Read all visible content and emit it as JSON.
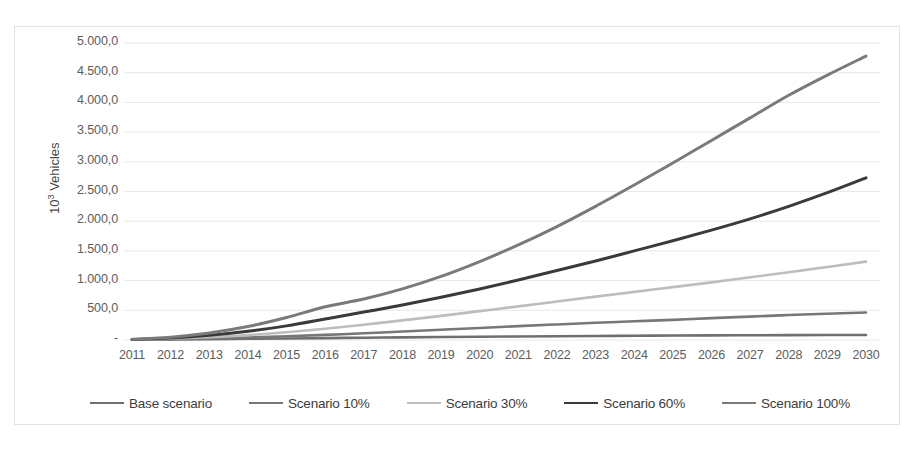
{
  "chart_data": {
    "type": "line",
    "title": "",
    "xlabel": "",
    "ylabel": "10³ Vehicles",
    "ylabel_html": "10<sup>3</sup> Vehicles",
    "grid": true,
    "legend_position": "bottom",
    "xlim": [
      2011,
      2030
    ],
    "ylim": [
      0,
      5000
    ],
    "ytick_values": [
      5000,
      4500,
      4000,
      3500,
      3000,
      2500,
      2000,
      1500,
      1000,
      500,
      0
    ],
    "ytick_labels": [
      "5.000,0",
      "4.500,0",
      "4.000,0",
      "3.500,0",
      "3.000,0",
      "2.500,0",
      "2.000,0",
      "1.500,0",
      "1.000,0",
      "500,0",
      "-"
    ],
    "categories": [
      2011,
      2012,
      2013,
      2014,
      2015,
      2016,
      2017,
      2018,
      2019,
      2020,
      2021,
      2022,
      2023,
      2024,
      2025,
      2026,
      2027,
      2028,
      2029,
      2030
    ],
    "xtick_labels": [
      "2011",
      "2012",
      "2013",
      "2014",
      "2015",
      "2016",
      "2017",
      "2018",
      "2019",
      "2020",
      "2021",
      "2022",
      "2023",
      "2024",
      "2025",
      "2026",
      "2027",
      "2028",
      "2029",
      "2030"
    ],
    "series": [
      {
        "name": "Base scenario",
        "color": "#6f6f6f",
        "width": 2.6,
        "values": [
          5,
          9,
          14,
          20,
          26,
          32,
          38,
          44,
          50,
          55,
          60,
          64,
          68,
          72,
          75,
          78,
          80,
          82,
          84,
          85
        ]
      },
      {
        "name": "Scenario 10%",
        "color": "#777777",
        "width": 2.6,
        "values": [
          6,
          14,
          26,
          42,
          62,
          86,
          113,
          142,
          172,
          203,
          233,
          262,
          290,
          315,
          338,
          369,
          394,
          420,
          442,
          462
        ]
      },
      {
        "name": "Scenario 30%",
        "color": "#bdbdbd",
        "width": 2.6,
        "values": [
          8,
          22,
          46,
          82,
          130,
          190,
          258,
          330,
          406,
          486,
          566,
          648,
          730,
          810,
          890,
          970,
          1055,
          1140,
          1230,
          1320
        ]
      },
      {
        "name": "Scenario 60%",
        "color": "#3a3a3a",
        "width": 3.0,
        "values": [
          10,
          34,
          78,
          146,
          238,
          352,
          470,
          590,
          720,
          860,
          1010,
          1170,
          1330,
          1500,
          1670,
          1850,
          2040,
          2250,
          2480,
          2730
        ]
      },
      {
        "name": "Scenario 100%",
        "color": "#7a7a7a",
        "width": 3.0,
        "values": [
          12,
          48,
          118,
          226,
          378,
          560,
          690,
          860,
          1070,
          1320,
          1600,
          1910,
          2250,
          2610,
          2980,
          3360,
          3740,
          4120,
          4460,
          4780
        ]
      }
    ]
  },
  "axis": {
    "y_title": "10",
    "y_title_sup": "3",
    "y_title_rest": " Vehicles"
  },
  "legend": {
    "items": [
      {
        "label": "Base scenario",
        "color": "#6f6f6f"
      },
      {
        "label": "Scenario 10%",
        "color": "#777777"
      },
      {
        "label": "Scenario 30%",
        "color": "#bdbdbd"
      },
      {
        "label": "Scenario 60%",
        "color": "#3a3a3a"
      },
      {
        "label": "Scenario 100%",
        "color": "#7a7a7a"
      }
    ]
  },
  "style": {
    "gridline_color": "#e8e8e8",
    "tick_text_color": "#5d5d5d",
    "frame_color": "#e2e2e2",
    "background": "#ffffff"
  }
}
